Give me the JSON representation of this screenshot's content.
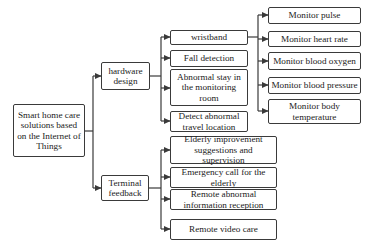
{
  "diagram": {
    "type": "tree",
    "root": {
      "label": "Smart home care solutions based on the Internet of Things"
    },
    "branches": [
      {
        "label": "hardware design",
        "children": [
          {
            "label": "wristband",
            "children": [
              {
                "label": "Monitor pulse"
              },
              {
                "label": "Monitor heart rate"
              },
              {
                "label": "Monitor blood oxygen"
              },
              {
                "label": "Monitor blood pressure"
              },
              {
                "label": "Monitor body temperature"
              }
            ]
          },
          {
            "label": "Fall detection"
          },
          {
            "label": "Abnormal stay in the monitoring room"
          },
          {
            "label": "Detect abnormal travel location"
          }
        ]
      },
      {
        "label": "Terminal feedback",
        "children": [
          {
            "label": "Elderly improvement suggestions and supervision"
          },
          {
            "label": "Emergency call for the elderly"
          },
          {
            "label": "Remote abnormal information reception"
          },
          {
            "label": "Remote video care"
          }
        ]
      }
    ],
    "colors": {
      "line": "#3a3a3a",
      "box_border": "#3a3a3a",
      "background": "#ffffff",
      "text": "#222222"
    }
  }
}
